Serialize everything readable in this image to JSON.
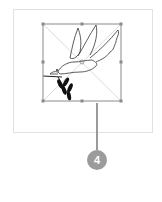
{
  "canvas": {
    "frame_border_color": "#e2e2e2",
    "selection_color": "#8a8a8a",
    "diagonal_color": "#d9d9d9"
  },
  "image": {
    "subject": "dove-with-olive-branch",
    "state": "selected"
  },
  "callout": {
    "number": "4",
    "color": "#9b9b9b"
  }
}
